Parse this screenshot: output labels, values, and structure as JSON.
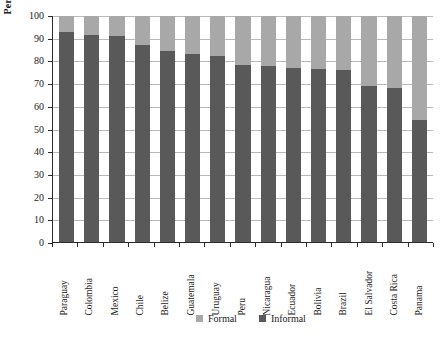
{
  "chart_data": {
    "type": "bar",
    "stacked": true,
    "title": "",
    "xlabel": "",
    "ylabel": "Percentage",
    "ylim": [
      0,
      100
    ],
    "ytick_values": [
      0,
      10,
      20,
      30,
      40,
      50,
      60,
      70,
      80,
      90,
      100
    ],
    "ytick_labels": [
      "0",
      "10",
      "20",
      "30",
      "40",
      "50",
      "60",
      "70",
      "80",
      "90",
      "100"
    ],
    "grid": true,
    "legend_position": "bottom",
    "categories": [
      "Paraguay",
      "Colombia",
      "Mexico",
      "Chile",
      "Belize",
      "Guatemala",
      "Uruguay",
      "Peru",
      "Nicaragua",
      "Ecuador",
      "Bolivia",
      "Brazil",
      "El Salvador",
      "Costa Rica",
      "Panama"
    ],
    "series": [
      {
        "name": "Informal",
        "color": "#595959",
        "values": [
          93,
          91.5,
          91,
          87,
          84.5,
          83,
          82.5,
          78.5,
          78,
          77,
          76.5,
          76,
          69,
          68,
          54
        ]
      },
      {
        "name": "Formal",
        "color": "#a8a8a8",
        "values": [
          7,
          8.5,
          9,
          13,
          15.5,
          17,
          17.5,
          21.5,
          22,
          23,
          23.5,
          24,
          31,
          32,
          46
        ]
      }
    ]
  },
  "legend": {
    "items": [
      {
        "label": "Formal",
        "color": "#a8a8a8"
      },
      {
        "label": "Informal",
        "color": "#595959"
      }
    ]
  },
  "caption": {
    "text": ""
  }
}
